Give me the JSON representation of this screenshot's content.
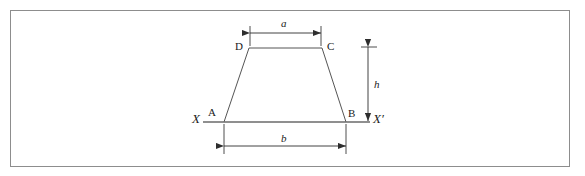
{
  "figure": {
    "type": "geometry-diagram",
    "colors": {
      "frame_border": "#8d8d8d",
      "shape_stroke": "#555555",
      "baseline_stroke": "#6a6a6a",
      "dimension_stroke": "#3a3a3a",
      "label_text": "#1a1a1a",
      "background": "#ffffff"
    },
    "vertex_labels": {
      "a_point": "A",
      "b_point": "B",
      "c_point": "C",
      "d_point": "D"
    },
    "axis_labels": {
      "left": "X",
      "right": "X′"
    },
    "dimension_labels": {
      "top_width": "a",
      "bottom_width": "b",
      "height": "h"
    },
    "geometry": {
      "vertex_a": [
        224,
        122
      ],
      "vertex_b": [
        346,
        122
      ],
      "vertex_c": [
        322,
        48
      ],
      "vertex_d": [
        249,
        48
      ],
      "baseline_start": [
        203,
        122
      ],
      "baseline_end": [
        370,
        122
      ],
      "dim_a_y": 33,
      "dim_a_x1": 250,
      "dim_a_x2": 321,
      "dim_b_y": 146,
      "dim_b_x1": 224,
      "dim_b_x2": 346,
      "dim_h_x": 368,
      "dim_h_y1": 47,
      "dim_h_y2": 121
    }
  }
}
